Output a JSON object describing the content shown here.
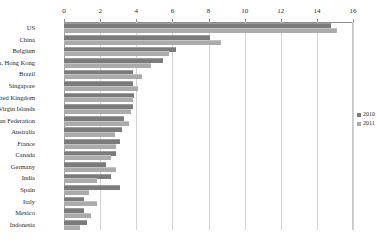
{
  "chart_data": {
    "type": "bar",
    "title": "",
    "subtitle": "",
    "xlabel": "",
    "ylabel": "",
    "orientation": "horizontal",
    "grid": true,
    "legend_position": "right",
    "xlim": [
      0,
      16
    ],
    "xticks": [
      0,
      2,
      4,
      6,
      8,
      10,
      12,
      14,
      16
    ],
    "xtick_labels": [
      "0",
      "2",
      "4",
      "6",
      "8",
      "10",
      "12",
      "14",
      "16"
    ],
    "categories": [
      "US",
      "China",
      "Belgium",
      "China, Hong Kong",
      "Brazil",
      "Singapore",
      "United Kingdom",
      "British Virgin Islands",
      "Russian Federation",
      "Australia",
      "France",
      "Canada",
      "Germany",
      "India",
      "Spain",
      "Italy",
      "Mexico",
      "Indonesia"
    ],
    "series": [
      {
        "name": "2010",
        "color": "#7b7b7b",
        "values": [
          14.8,
          8.1,
          6.2,
          5.5,
          3.8,
          3.8,
          3.9,
          3.8,
          3.3,
          3.2,
          3.1,
          2.9,
          2.3,
          2.6,
          3.1,
          1.1,
          1.1,
          1.3
        ]
      },
      {
        "name": "2011",
        "color": "#ababab",
        "values": [
          15.1,
          8.7,
          5.8,
          4.8,
          4.3,
          4.1,
          3.8,
          3.7,
          3.6,
          2.8,
          2.9,
          2.6,
          2.9,
          1.8,
          1.4,
          1.8,
          1.5,
          0.9
        ]
      }
    ]
  },
  "legend": {
    "items": [
      {
        "label": "2010"
      },
      {
        "label": "2011"
      }
    ]
  }
}
